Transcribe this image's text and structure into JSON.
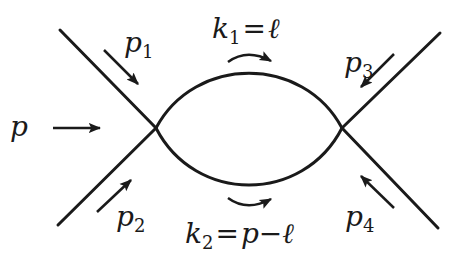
{
  "diagram": {
    "type": "feynman-bubble",
    "colors": {
      "stroke": "#1a1a1a",
      "background": "#ffffff"
    },
    "vertices": [
      {
        "id": "left",
        "x": 156,
        "y": 128
      },
      {
        "id": "right",
        "x": 342,
        "y": 128
      }
    ],
    "external_legs": [
      {
        "id": "p1",
        "label": "p",
        "subscript": "1",
        "from": [
          60,
          30
        ],
        "to": [
          156,
          128
        ],
        "arrow": "inward"
      },
      {
        "id": "p2",
        "label": "p",
        "subscript": "2",
        "from": [
          58,
          225
        ],
        "to": [
          156,
          128
        ],
        "arrow": "inward"
      },
      {
        "id": "p3",
        "label": "p",
        "subscript": "3",
        "from": [
          440,
          33
        ],
        "to": [
          342,
          128
        ],
        "arrow": "inward"
      },
      {
        "id": "p4",
        "label": "p",
        "subscript": "4",
        "from": [
          438,
          228
        ],
        "to": [
          342,
          128
        ],
        "arrow": "inward"
      }
    ],
    "incoming_total": {
      "label": "p",
      "arrow": "right"
    },
    "internal_lines": [
      {
        "id": "k1",
        "label": "k",
        "subscript": "1",
        "equals": "=",
        "value": "ℓ",
        "position": "top"
      },
      {
        "id": "k2",
        "label": "k",
        "subscript": "2",
        "equals": "=",
        "value_parts": [
          "p",
          "−",
          "ℓ"
        ],
        "position": "bottom"
      }
    ]
  },
  "labels": {
    "p": "p",
    "p1": {
      "base": "p",
      "sub": "1"
    },
    "p2": {
      "base": "p",
      "sub": "2"
    },
    "p3": {
      "base": "p",
      "sub": "3"
    },
    "p4": {
      "base": "p",
      "sub": "4"
    },
    "k1": {
      "base": "k",
      "sub": "1",
      "eq": "=",
      "rhs": "ℓ"
    },
    "k2": {
      "base": "k",
      "sub": "2",
      "eq": "=",
      "rhs_p": "p",
      "rhs_minus": "−",
      "rhs_l": "ℓ"
    }
  }
}
